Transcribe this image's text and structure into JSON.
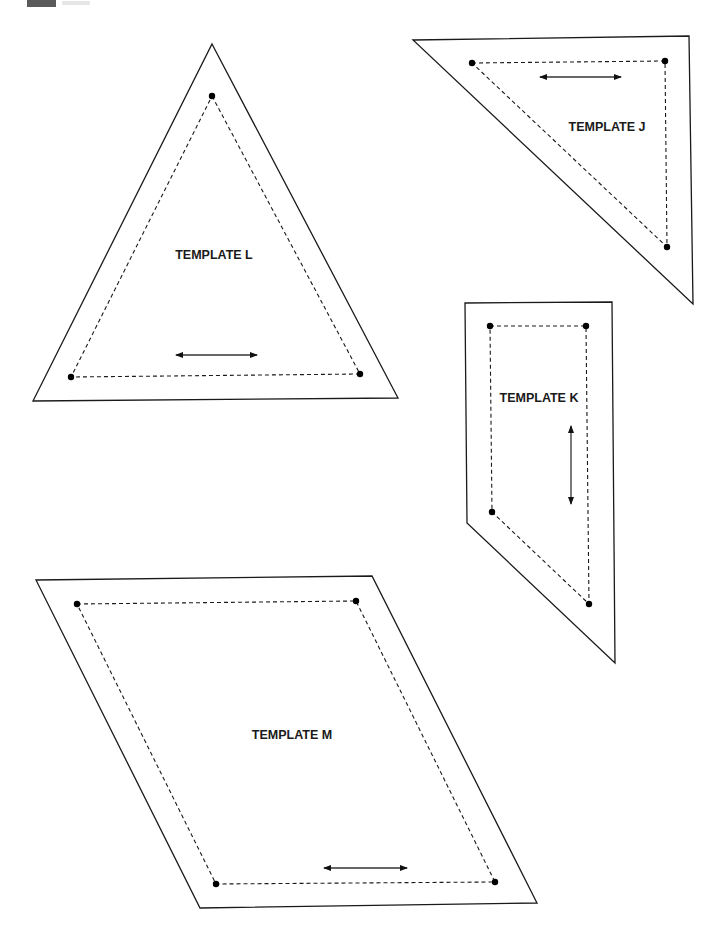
{
  "page": {
    "width": 726,
    "height": 936,
    "background": "#ffffff",
    "tab_color": "#5a5a5a"
  },
  "templates": [
    {
      "id": "L",
      "label": "TEMPLATE L",
      "label_pos": [
        214,
        259
      ],
      "outer": [
        [
          212,
          44
        ],
        [
          398,
          398
        ],
        [
          33,
          401
        ]
      ],
      "seam": [
        [
          212,
          96
        ],
        [
          360,
          374
        ],
        [
          71,
          377
        ]
      ],
      "grain": {
        "from": [
          176,
          355
        ],
        "to": [
          257,
          355
        ]
      }
    },
    {
      "id": "J",
      "label": "TEMPLATE J",
      "label_pos": [
        607,
        131
      ],
      "outer": [
        [
          413,
          40
        ],
        [
          689,
          36
        ],
        [
          693,
          304
        ]
      ],
      "seam": [
        [
          472,
          63
        ],
        [
          665,
          61
        ],
        [
          667,
          247
        ]
      ],
      "grain": {
        "from": [
          540,
          77
        ],
        "to": [
          621,
          77
        ]
      }
    },
    {
      "id": "K",
      "label": "TEMPLATE K",
      "label_pos": [
        539,
        402
      ],
      "outer": [
        [
          465,
          303
        ],
        [
          612,
          302
        ],
        [
          615,
          663
        ],
        [
          467,
          523
        ]
      ],
      "seam": [
        [
          490,
          326
        ],
        [
          586,
          326
        ],
        [
          589,
          604
        ],
        [
          492,
          512
        ]
      ],
      "grain": {
        "from": [
          571,
          426
        ],
        "to": [
          571,
          504
        ]
      }
    },
    {
      "id": "M",
      "label": "TEMPLATE M",
      "label_pos": [
        292,
        739
      ],
      "outer": [
        [
          36,
          580
        ],
        [
          372,
          576
        ],
        [
          537,
          903
        ],
        [
          200,
          908
        ]
      ],
      "seam": [
        [
          77,
          604
        ],
        [
          356,
          601
        ],
        [
          495,
          882
        ],
        [
          216,
          884
        ]
      ],
      "grain": {
        "from": [
          324,
          868
        ],
        "to": [
          407,
          868
        ]
      }
    }
  ]
}
